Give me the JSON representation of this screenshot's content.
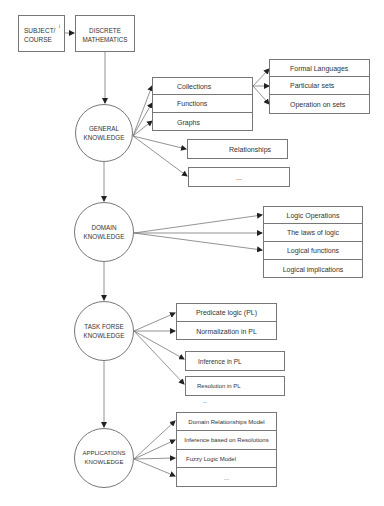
{
  "top": {
    "subject_box": "SUBJECT/ COURSE",
    "subject_mark": "ʲ",
    "discrete_box": "DISCRETE MATHEMATICS"
  },
  "nodes": {
    "general": "GENERAL KNOWLEDGE",
    "domain": "DOMAIN KNOWLEDGE",
    "task": "TASK FORSE KNOWLEDGE",
    "applications": "APPLICATIONS KNOWLEDGE"
  },
  "general": {
    "group1": [
      "Collections",
      "Functions",
      "Graphs"
    ],
    "subgroup": [
      "Formal Languages",
      "Particular sets",
      "Operation  on sets"
    ],
    "relationships": "Relationships",
    "ellipsis": "..."
  },
  "domain": {
    "items": [
      "Logic Operations",
      "The laws of logic",
      "Logical functions",
      "Logical implications"
    ]
  },
  "task": {
    "group": [
      "Predicate logic (PL)",
      "Normalization  in PL"
    ],
    "inference": "Inference in PL",
    "resolution": "Resolution in PL",
    "ellipsis": ".."
  },
  "applications": {
    "items": [
      "Domain Relationships Model",
      "Inference based on Resolutions",
      "Fuzzy Logic Model",
      "..."
    ]
  },
  "colors": {
    "line": "#777777",
    "arrow": "#222222",
    "text": "#333333"
  }
}
